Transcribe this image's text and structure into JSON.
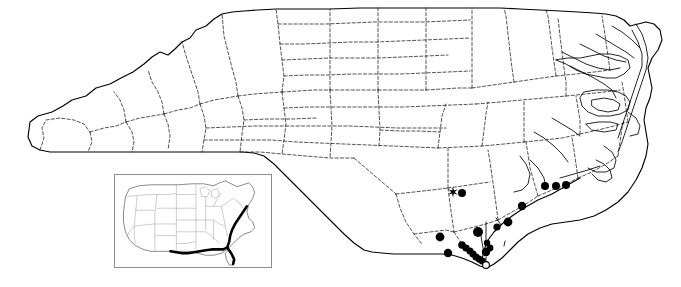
{
  "figure": {
    "kind": "species-distribution-map",
    "region_label": "North Carolina",
    "inset_label": "United States",
    "caption": ""
  },
  "legend": {
    "filled_circle_meaning": "documented occurrence record",
    "open_circle_meaning": "historical or unverified record",
    "star_meaning": "type locality / notable record"
  },
  "colors": {
    "outline": "#000000",
    "county_line": "#1a1a1a",
    "dot_fill": "#000000",
    "open_dot_fill": "#ffffff",
    "inset_border": "#8c8c8c",
    "inset_state_line": "#9a9a9a",
    "inset_highlight": "#000000",
    "background": "#ffffff"
  },
  "markers": {
    "filled_circles": [
      {
        "x": 462,
        "y": 193,
        "r": 4.0
      },
      {
        "x": 545,
        "y": 186,
        "r": 4.0
      },
      {
        "x": 556,
        "y": 186,
        "r": 4.0
      },
      {
        "x": 566,
        "y": 185,
        "r": 4.0
      },
      {
        "x": 522,
        "y": 206,
        "r": 4.2
      },
      {
        "x": 508,
        "y": 222,
        "r": 4.4
      },
      {
        "x": 497,
        "y": 227,
        "r": 3.6
      },
      {
        "x": 478,
        "y": 232,
        "r": 5.0
      },
      {
        "x": 440,
        "y": 237,
        "r": 4.4
      },
      {
        "x": 448,
        "y": 253,
        "r": 4.2
      },
      {
        "x": 462,
        "y": 245,
        "r": 3.8
      },
      {
        "x": 466,
        "y": 248,
        "r": 3.6
      },
      {
        "x": 470,
        "y": 251,
        "r": 3.6
      },
      {
        "x": 473,
        "y": 254,
        "r": 3.6
      },
      {
        "x": 476,
        "y": 257,
        "r": 3.6
      },
      {
        "x": 479,
        "y": 259,
        "r": 3.4
      },
      {
        "x": 482,
        "y": 261,
        "r": 3.4
      },
      {
        "x": 486,
        "y": 252,
        "r": 4.2
      },
      {
        "x": 490,
        "y": 248,
        "r": 3.4
      },
      {
        "x": 487,
        "y": 243,
        "r": 3.2
      }
    ],
    "open_circles": [
      {
        "x": 486,
        "y": 265,
        "r": 3.4
      }
    ],
    "stars": [
      {
        "x": 453,
        "y": 192,
        "r": 5.4
      }
    ]
  },
  "counts": {
    "filled": 20,
    "open": 1,
    "star": 1
  }
}
